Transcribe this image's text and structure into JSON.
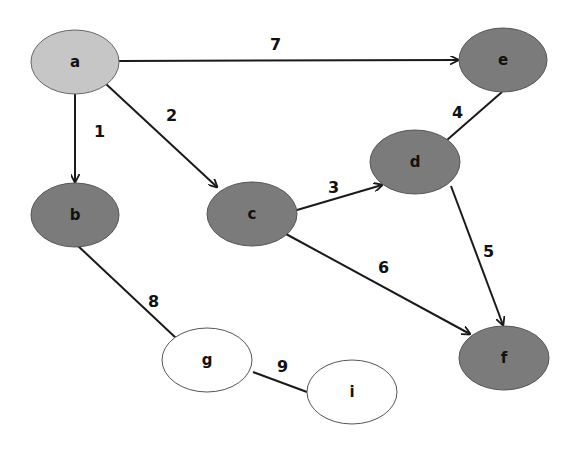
{
  "diagram": {
    "type": "weighted-graph",
    "colors": {
      "start_node": "#c6c6c6",
      "visited_node": "#7b7b7b",
      "unvisited_node": "#ffffff",
      "edge": "#1a1a1a",
      "node_border": "#555555"
    },
    "nodes": [
      {
        "id": "a",
        "label": "a",
        "state": "start"
      },
      {
        "id": "b",
        "label": "b",
        "state": "visited"
      },
      {
        "id": "c",
        "label": "c",
        "state": "visited"
      },
      {
        "id": "d",
        "label": "d",
        "state": "visited"
      },
      {
        "id": "e",
        "label": "e",
        "state": "visited"
      },
      {
        "id": "f",
        "label": "f",
        "state": "visited"
      },
      {
        "id": "g",
        "label": "g",
        "state": "unvisited"
      },
      {
        "id": "i",
        "label": "i",
        "state": "unvisited"
      }
    ],
    "edges": [
      {
        "from": "a",
        "to": "b",
        "label": "1",
        "directed": true
      },
      {
        "from": "a",
        "to": "c",
        "label": "2",
        "directed": true
      },
      {
        "from": "c",
        "to": "d",
        "label": "3",
        "directed": true
      },
      {
        "from": "d",
        "to": "e",
        "label": "4",
        "directed": false
      },
      {
        "from": "d",
        "to": "f",
        "label": "5",
        "directed": true
      },
      {
        "from": "c",
        "to": "f",
        "label": "6",
        "directed": true
      },
      {
        "from": "a",
        "to": "e",
        "label": "7",
        "directed": true
      },
      {
        "from": "b",
        "to": "g",
        "label": "8",
        "directed": false
      },
      {
        "from": "g",
        "to": "i",
        "label": "9",
        "directed": false
      }
    ]
  }
}
